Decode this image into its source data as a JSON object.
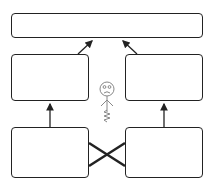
{
  "diagram": {
    "stroke_color": "#222222",
    "figure_color": "#888888",
    "boxes": [
      {
        "id": "top",
        "label": ""
      },
      {
        "id": "middle-left",
        "label": ""
      },
      {
        "id": "middle-right",
        "label": ""
      },
      {
        "id": "bottom-left",
        "label": ""
      },
      {
        "id": "bottom-right",
        "label": ""
      }
    ],
    "connectors": [
      {
        "from": "bottom-left",
        "to": "middle-left",
        "type": "arrow"
      },
      {
        "from": "bottom-right",
        "to": "middle-right",
        "type": "arrow"
      },
      {
        "from": "middle-left",
        "to": "top",
        "type": "arrow"
      },
      {
        "from": "middle-right",
        "to": "top",
        "type": "arrow"
      },
      {
        "from": "bottom-left",
        "to": "bottom-right",
        "type": "cross-line"
      },
      {
        "from": "bottom-right",
        "to": "bottom-left",
        "type": "cross-line"
      }
    ],
    "figure": {
      "icon": "sad-stick-figure-on-spring",
      "expression": "sad"
    }
  }
}
